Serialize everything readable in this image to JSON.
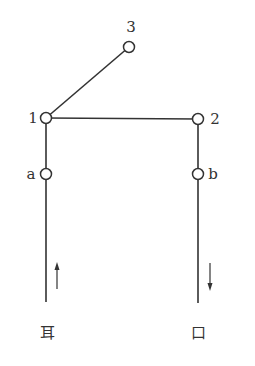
{
  "diagram": {
    "type": "node-graph",
    "colors": {
      "stroke": "#333333",
      "background": "#ffffff"
    },
    "nodes": [
      {
        "id": "3",
        "label": "3",
        "x": 129,
        "y": 47
      },
      {
        "id": "1",
        "label": "1",
        "x": 46,
        "y": 118
      },
      {
        "id": "2",
        "label": "2",
        "x": 198,
        "y": 119
      },
      {
        "id": "a",
        "label": "a",
        "x": 46,
        "y": 174
      },
      {
        "id": "b",
        "label": "b",
        "x": 198,
        "y": 174
      }
    ],
    "edges": [
      {
        "from": "1",
        "to": "3"
      },
      {
        "from": "1",
        "to": "2"
      },
      {
        "from": "1",
        "to": "a"
      },
      {
        "from": "2",
        "to": "b"
      }
    ],
    "terminals": [
      {
        "id": "ear",
        "label": "耳",
        "from_node": "a",
        "direction": "up"
      },
      {
        "id": "mouth",
        "label": "口",
        "from_node": "b",
        "direction": "down"
      }
    ]
  }
}
